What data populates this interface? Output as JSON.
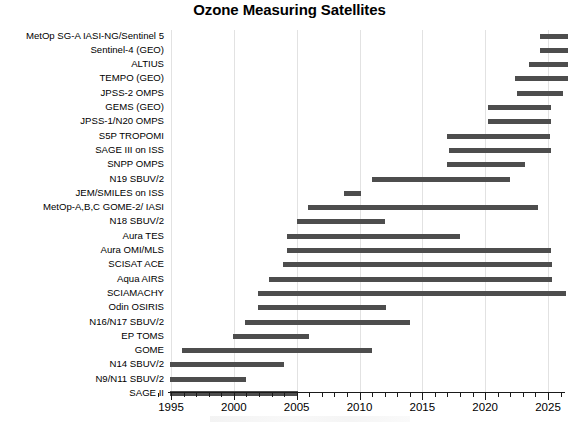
{
  "chart_data": {
    "type": "bar",
    "orientation": "horizontal-gantt",
    "title": "Ozone Measuring Satellites",
    "xlabel": "",
    "ylabel": "",
    "xlim": [
      1994.8,
      2026.2
    ],
    "grid": true,
    "legend": null,
    "bar_color": "#4d4d4d",
    "x_ticks_major": [
      "1995",
      "2000",
      "2005",
      "2010",
      "2015",
      "2020",
      "2025"
    ],
    "x_tick_major_values": [
      1995,
      2000,
      2005,
      2010,
      2015,
      2020,
      2025
    ],
    "x_minor_tick_step": 1,
    "categories": [
      "MetOp SG-A IASI-NG/Sentinel 5",
      "Sentinel-4 (GEO)",
      "ALTIUS",
      "TEMPO (GEO)",
      "JPSS-2 OMPS",
      "GEMS (GEO)",
      "JPSS-1/N20 OMPS",
      "S5P TROPOMI",
      "SAGE III on ISS",
      "SNPP OMPS",
      "N19 SBUV/2",
      "JEM/SMILES on ISS",
      "MetOp-A,B,C GOME-2/ IASI",
      "N18 SBUV/2",
      "Aura TES",
      "Aura OMI/MLS",
      "SCISAT ACE",
      "Aqua AIRS",
      "SCIAMACHY",
      "Odin OSIRIS",
      "N16/N17 SBUV/2",
      "EP TOMS",
      "GOME",
      "N14 SBUV/2",
      "N9/N11 SBUV/2",
      "SAGE II"
    ],
    "bars": [
      {
        "label": "MetOp SG-A IASI-NG/Sentinel 5",
        "start": 2024.4,
        "end": 2026.6
      },
      {
        "label": "Sentinel-4 (GEO)",
        "start": 2024.4,
        "end": 2026.6
      },
      {
        "label": "ALTIUS",
        "start": 2023.5,
        "end": 2026.6
      },
      {
        "label": "TEMPO (GEO)",
        "start": 2022.4,
        "end": 2026.6
      },
      {
        "label": "JPSS-2 OMPS",
        "start": 2022.5,
        "end": 2026.2
      },
      {
        "label": "GEMS (GEO)",
        "start": 2020.2,
        "end": 2025.2
      },
      {
        "label": "JPSS-1/N20 OMPS",
        "start": 2020.2,
        "end": 2025.2
      },
      {
        "label": "S5P TROPOMI",
        "start": 2017.0,
        "end": 2025.2
      },
      {
        "label": "SAGE III on ISS",
        "start": 2017.1,
        "end": 2025.2
      },
      {
        "label": "SNPP OMPS",
        "start": 2017.0,
        "end": 2023.2
      },
      {
        "label": "N19 SBUV/2",
        "start": 2011.0,
        "end": 2022.0
      },
      {
        "label": "JEM/SMILES on ISS",
        "start": 2008.8,
        "end": 2010.1
      },
      {
        "label": "MetOp-A,B,C GOME-2/ IASI",
        "start": 2005.9,
        "end": 2024.2
      },
      {
        "label": "N18 SBUV/2",
        "start": 2005.0,
        "end": 2012.0
      },
      {
        "label": "Aura TES",
        "start": 2004.2,
        "end": 2018.0
      },
      {
        "label": "Aura OMI/MLS",
        "start": 2004.2,
        "end": 2025.2
      },
      {
        "label": "SCISAT ACE",
        "start": 2003.9,
        "end": 2025.3
      },
      {
        "label": "Aqua AIRS",
        "start": 2002.8,
        "end": 2025.3
      },
      {
        "label": "SCIAMACHY",
        "start": 2001.9,
        "end": 2026.4
      },
      {
        "label": "Odin OSIRIS",
        "start": 2001.9,
        "end": 2012.1
      },
      {
        "label": "N16/N17 SBUV/2",
        "start": 2000.9,
        "end": 2014.0
      },
      {
        "label": "EP TOMS",
        "start": 1999.9,
        "end": 2006.0
      },
      {
        "label": "GOME",
        "start": 1995.9,
        "end": 2011.0
      },
      {
        "label": "N14 SBUV/2",
        "start": 1994.9,
        "end": 2004.0
      },
      {
        "label": "N9/N11 SBUV/2",
        "start": 1994.9,
        "end": 2001.0
      },
      {
        "label": "SAGE II",
        "start": 1994.9,
        "end": 2005.1
      }
    ]
  }
}
